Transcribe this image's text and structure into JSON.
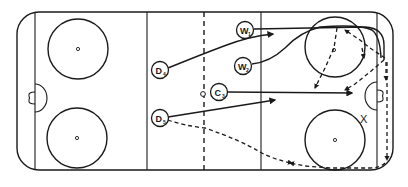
{
  "diagram": {
    "type": "ice-hockey-rink-play",
    "colors": {
      "ink": "#1a1a1a",
      "background": "#ffffff"
    },
    "players": [
      {
        "id": "W1",
        "letter": "W",
        "number": "1",
        "role": "wing"
      },
      {
        "id": "W2",
        "letter": "W",
        "number": "2",
        "role": "wing"
      },
      {
        "id": "D4",
        "letter": "D",
        "number": "4",
        "role": "defense"
      },
      {
        "id": "C3",
        "letter": "C",
        "number": "3",
        "role": "center"
      },
      {
        "id": "D5",
        "letter": "D",
        "number": "5",
        "role": "defense"
      }
    ],
    "markers": [
      {
        "id": "X",
        "label": "X"
      }
    ],
    "legend": {
      "solid_line": "skating path",
      "dashed_arrow_line": "puck / pass path"
    }
  }
}
